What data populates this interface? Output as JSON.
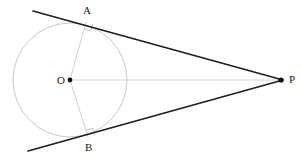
{
  "figure": {
    "kind": "geometry-diagram",
    "width": 302,
    "height": 163,
    "background_color": "#ffffff",
    "colors": {
      "tangent_line": "#1f1f1f",
      "circle_stroke": "#c9c9c9",
      "radius_stroke": "#cfcfcf",
      "center_line": "#e2e2e2",
      "right_angle_mark": "#c0c0c0",
      "point_fill": "#111111",
      "label_text": "#1a1a1a"
    },
    "circle": {
      "center_x": 70,
      "center_y": 80,
      "radius": 57,
      "stroke_width": 1
    },
    "points": [
      {
        "id": "O",
        "label": "O",
        "x": 70,
        "y": 80,
        "label_x": 57,
        "label_y": 75,
        "dot": true,
        "dot_radius": 2.4
      },
      {
        "id": "A",
        "label": "A",
        "x": 86,
        "y": 22,
        "label_x": 83,
        "label_y": 5,
        "dot": false,
        "dot_radius": 0
      },
      {
        "id": "B",
        "label": "B",
        "x": 88,
        "y": 137,
        "label_x": 85,
        "label_y": 142,
        "dot": false,
        "dot_radius": 0
      },
      {
        "id": "P",
        "label": "P",
        "x": 281,
        "y": 80,
        "label_x": 289,
        "label_y": 74,
        "dot": true,
        "dot_radius": 2.6
      }
    ],
    "tangent_lines": [
      {
        "id": "upper-tangent",
        "from_x": 33,
        "from_y": 11,
        "to_x": 283,
        "to_y": 80,
        "stroke_width": 1.7,
        "through": "A"
      },
      {
        "id": "lower-tangent",
        "from_x": 28,
        "from_y": 151,
        "to_x": 283,
        "to_y": 80,
        "stroke_width": 1.7,
        "through": "B"
      }
    ],
    "radii": [
      {
        "id": "radius-OA",
        "from_x": 70,
        "from_y": 80,
        "to_x": 86,
        "to_y": 22,
        "stroke_width": 1
      },
      {
        "id": "radius-OB",
        "from_x": 70,
        "from_y": 80,
        "to_x": 88,
        "to_y": 137,
        "stroke_width": 1
      }
    ],
    "center_segment": {
      "id": "segment-OP",
      "from_x": 70,
      "from_y": 80,
      "to_x": 281,
      "to_y": 80,
      "stroke_width": 1.6
    },
    "right_angles": [
      {
        "id": "right-angle-at-A",
        "vertex_x": 86,
        "vertex_y": 22,
        "size": 7,
        "toward_center_x": 70,
        "toward_center_y": 80,
        "toward_p_x": 281,
        "toward_p_y": 80
      },
      {
        "id": "right-angle-at-B",
        "vertex_x": 88,
        "vertex_y": 137,
        "size": 7,
        "toward_center_x": 70,
        "toward_center_y": 80,
        "toward_p_x": 281,
        "toward_p_y": 80
      }
    ]
  }
}
